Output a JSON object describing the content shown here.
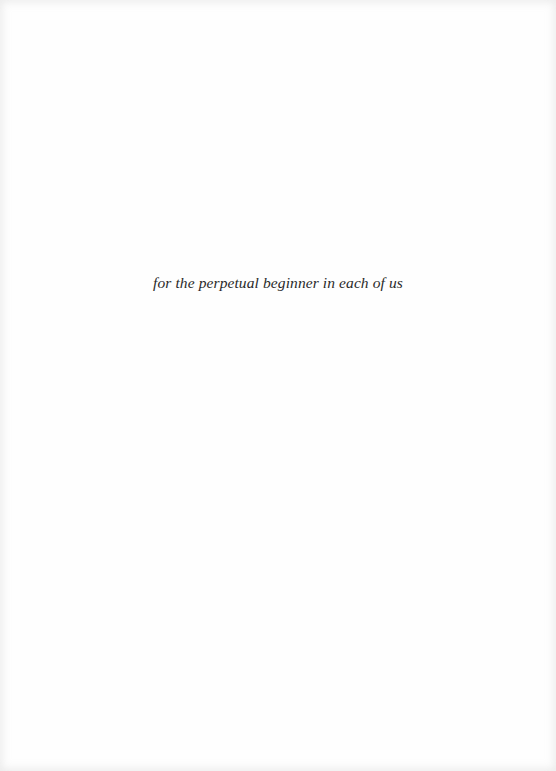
{
  "page": {
    "type": "dedication",
    "dedication_text": "for the perpetual beginner in each of us"
  }
}
